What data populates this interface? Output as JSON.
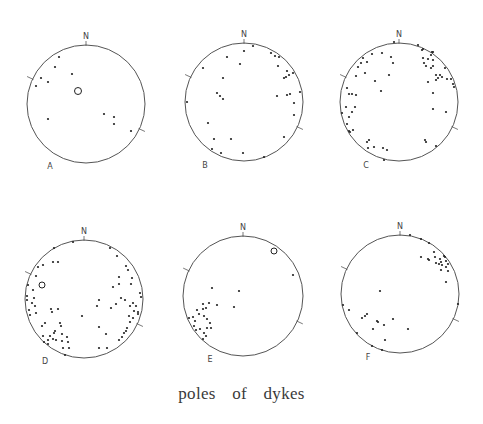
{
  "caption": "poles of dykes",
  "colors": {
    "outline": "#555555",
    "dot": "#222222",
    "text": "#444444"
  },
  "north_label": "N",
  "stereonets": [
    {
      "label": "A",
      "cx": 86,
      "cy": 104,
      "r": 59,
      "label_pos": [
        50,
        169
      ],
      "open_circles": [
        {
          "x": 78,
          "y": 91,
          "r": 3.5
        }
      ],
      "poles": [
        [
          59,
          57
        ],
        [
          55,
          67
        ],
        [
          41,
          78
        ],
        [
          48,
          82
        ],
        [
          36,
          86
        ],
        [
          72,
          74
        ],
        [
          48,
          119
        ],
        [
          104,
          114
        ],
        [
          114,
          117
        ],
        [
          114,
          124
        ],
        [
          131,
          131
        ]
      ]
    },
    {
      "label": "B",
      "cx": 244,
      "cy": 102,
      "r": 59,
      "label_pos": [
        205,
        168
      ],
      "open_circles": [],
      "poles": [
        [
          253,
          46
        ],
        [
          244,
          51
        ],
        [
          227,
          57
        ],
        [
          240,
          64
        ],
        [
          271,
          53
        ],
        [
          275,
          56
        ],
        [
          279,
          57
        ],
        [
          278,
          66
        ],
        [
          203,
          68
        ],
        [
          287,
          71
        ],
        [
          293,
          73
        ],
        [
          284,
          78
        ],
        [
          286,
          77
        ],
        [
          289,
          75
        ],
        [
          223,
          78
        ],
        [
          217,
          93
        ],
        [
          220,
          96
        ],
        [
          223,
          99
        ],
        [
          277,
          96
        ],
        [
          287,
          95
        ],
        [
          290,
          94
        ],
        [
          300,
          92
        ],
        [
          187,
          102
        ],
        [
          294,
          103
        ],
        [
          294,
          115
        ],
        [
          208,
          123
        ],
        [
          284,
          137
        ],
        [
          214,
          139
        ],
        [
          231,
          139
        ],
        [
          212,
          149
        ],
        [
          221,
          153
        ],
        [
          243,
          153
        ],
        [
          264,
          157
        ]
      ]
    },
    {
      "label": "C",
      "cx": 399,
      "cy": 102,
      "r": 59,
      "label_pos": [
        366,
        168
      ],
      "open_circles": [],
      "poles": [
        [
          394,
          42
        ],
        [
          418,
          45
        ],
        [
          422,
          50
        ],
        [
          423,
          49
        ],
        [
          432,
          52
        ],
        [
          431,
          55
        ],
        [
          433,
          52
        ],
        [
          423,
          58
        ],
        [
          428,
          59
        ],
        [
          433,
          60
        ],
        [
          424,
          63
        ],
        [
          426,
          66
        ],
        [
          431,
          68
        ],
        [
          433,
          66
        ],
        [
          445,
          68
        ],
        [
          382,
          53
        ],
        [
          372,
          54
        ],
        [
          391,
          57
        ],
        [
          393,
          63
        ],
        [
          363,
          58
        ],
        [
          367,
          62
        ],
        [
          361,
          63
        ],
        [
          358,
          67
        ],
        [
          365,
          73
        ],
        [
          356,
          76
        ],
        [
          389,
          75
        ],
        [
          375,
          81
        ],
        [
          436,
          75
        ],
        [
          440,
          75
        ],
        [
          442,
          77
        ],
        [
          438,
          78
        ],
        [
          436,
          80
        ],
        [
          447,
          79
        ],
        [
          451,
          79
        ],
        [
          453,
          84
        ],
        [
          454,
          87
        ],
        [
          428,
          82
        ],
        [
          381,
          91
        ],
        [
          347,
          88
        ],
        [
          349,
          94
        ],
        [
          352,
          94
        ],
        [
          356,
          95
        ],
        [
          433,
          93
        ],
        [
          346,
          107
        ],
        [
          355,
          107
        ],
        [
          352,
          112
        ],
        [
          342,
          113
        ],
        [
          433,
          109
        ],
        [
          446,
          112
        ],
        [
          349,
          117
        ],
        [
          347,
          124
        ],
        [
          353,
          130
        ],
        [
          349,
          131
        ],
        [
          350,
          132
        ],
        [
          369,
          140
        ],
        [
          367,
          142
        ],
        [
          425,
          140
        ],
        [
          426,
          142
        ],
        [
          368,
          148
        ],
        [
          374,
          147
        ],
        [
          383,
          148
        ],
        [
          387,
          150
        ],
        [
          436,
          146
        ],
        [
          384,
          160
        ]
      ]
    },
    {
      "label": "D",
      "cx": 84,
      "cy": 299,
      "r": 59,
      "label_pos": [
        45,
        364
      ],
      "open_circles": [
        {
          "x": 42,
          "y": 285,
          "r": 3
        }
      ],
      "poles": [
        [
          73,
          242
        ],
        [
          54,
          248
        ],
        [
          110,
          248
        ],
        [
          117,
          256
        ],
        [
          53,
          262
        ],
        [
          58,
          262
        ],
        [
          43,
          265
        ],
        [
          38,
          267
        ],
        [
          126,
          266
        ],
        [
          128,
          270
        ],
        [
          36,
          276
        ],
        [
          119,
          277
        ],
        [
          132,
          278
        ],
        [
          119,
          284
        ],
        [
          131,
          284
        ],
        [
          113,
          287
        ],
        [
          33,
          290
        ],
        [
          28,
          285
        ],
        [
          27,
          296
        ],
        [
          27,
          300
        ],
        [
          34,
          298
        ],
        [
          32,
          303
        ],
        [
          35,
          306
        ],
        [
          140,
          293
        ],
        [
          141,
          297
        ],
        [
          121,
          298
        ],
        [
          125,
          300
        ],
        [
          99,
          300
        ],
        [
          97,
          306
        ],
        [
          116,
          304
        ],
        [
          111,
          308
        ],
        [
          133,
          303
        ],
        [
          136,
          306
        ],
        [
          130,
          306
        ],
        [
          51,
          309
        ],
        [
          58,
          309
        ],
        [
          52,
          312
        ],
        [
          134,
          311
        ],
        [
          138,
          312
        ],
        [
          138,
          314
        ],
        [
          29,
          310
        ],
        [
          36,
          313
        ],
        [
          30,
          315
        ],
        [
          82,
          316
        ],
        [
          129,
          316
        ],
        [
          133,
          318
        ],
        [
          45,
          323
        ],
        [
          42,
          326
        ],
        [
          60,
          323
        ],
        [
          61,
          326
        ],
        [
          130,
          322
        ],
        [
          99,
          327
        ],
        [
          127,
          328
        ],
        [
          55,
          331
        ],
        [
          54,
          333
        ],
        [
          62,
          334
        ],
        [
          126,
          331
        ],
        [
          124,
          333
        ],
        [
          106,
          334
        ],
        [
          50,
          336
        ],
        [
          43,
          336
        ],
        [
          67,
          337
        ],
        [
          122,
          337
        ],
        [
          53,
          339
        ],
        [
          56,
          340
        ],
        [
          48,
          340
        ],
        [
          62,
          341
        ],
        [
          68,
          342
        ],
        [
          119,
          340
        ],
        [
          44,
          342
        ],
        [
          48,
          344
        ],
        [
          63,
          348
        ],
        [
          69,
          348
        ],
        [
          99,
          348
        ],
        [
          107,
          348
        ],
        [
          65,
          355
        ]
      ]
    },
    {
      "label": "E",
      "cx": 243,
      "cy": 296,
      "r": 60,
      "label_pos": [
        210,
        362
      ],
      "open_circles": [
        {
          "x": 274,
          "y": 251,
          "r": 3
        }
      ],
      "poles": [
        [
          293,
          275
        ],
        [
          212,
          288
        ],
        [
          239,
          291
        ],
        [
          203,
          304
        ],
        [
          209,
          303
        ],
        [
          217,
          305
        ],
        [
          206,
          308
        ],
        [
          203,
          309
        ],
        [
          234,
          307
        ],
        [
          197,
          310
        ],
        [
          199,
          314
        ],
        [
          193,
          317
        ],
        [
          204,
          316
        ],
        [
          189,
          318
        ],
        [
          207,
          319
        ],
        [
          195,
          321
        ],
        [
          210,
          323
        ],
        [
          194,
          326
        ],
        [
          207,
          328
        ],
        [
          211,
          328
        ],
        [
          200,
          329
        ],
        [
          196,
          330
        ],
        [
          204,
          333
        ],
        [
          206,
          336
        ],
        [
          203,
          339
        ]
      ]
    },
    {
      "label": "F",
      "cx": 400,
      "cy": 294,
      "r": 59,
      "label_pos": [
        368,
        360
      ],
      "open_circles": [],
      "poles": [
        [
          410,
          235
        ],
        [
          421,
          239
        ],
        [
          429,
          243
        ],
        [
          434,
          252
        ],
        [
          421,
          257
        ],
        [
          428,
          259
        ],
        [
          429,
          260
        ],
        [
          435,
          257
        ],
        [
          440,
          259
        ],
        [
          444,
          256
        ],
        [
          445,
          257
        ],
        [
          441,
          262
        ],
        [
          436,
          263
        ],
        [
          439,
          264
        ],
        [
          446,
          261
        ],
        [
          448,
          264
        ],
        [
          442,
          265
        ],
        [
          446,
          267
        ],
        [
          441,
          270
        ],
        [
          448,
          271
        ],
        [
          446,
          282
        ],
        [
          380,
          291
        ],
        [
          343,
          305
        ],
        [
          349,
          310
        ],
        [
          458,
          304
        ],
        [
          367,
          314
        ],
        [
          365,
          316
        ],
        [
          362,
          318
        ],
        [
          393,
          319
        ],
        [
          377,
          321
        ],
        [
          378,
          322
        ],
        [
          384,
          325
        ],
        [
          373,
          329
        ],
        [
          408,
          329
        ],
        [
          357,
          333
        ],
        [
          385,
          340
        ],
        [
          372,
          346
        ],
        [
          382,
          350
        ]
      ]
    }
  ]
}
